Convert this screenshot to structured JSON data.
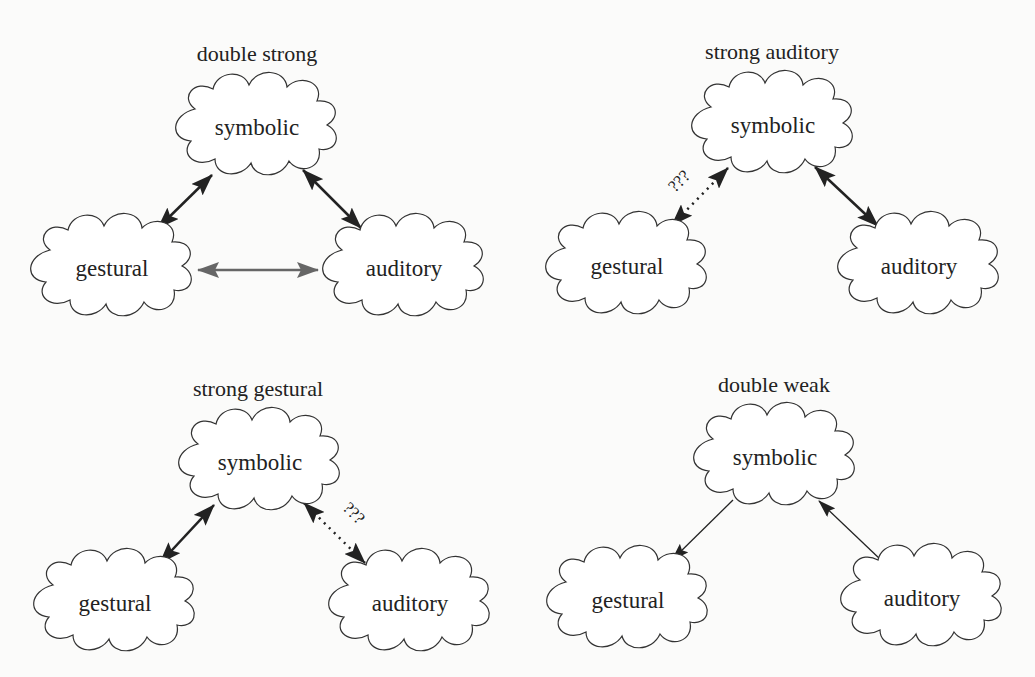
{
  "nodes": {
    "symbolic": "symbolic",
    "gestural": "gestural",
    "auditory": "auditory"
  },
  "uncertain_label": "???",
  "panels": [
    {
      "title": "double strong",
      "edges": [
        {
          "from": "symbolic",
          "to": "gestural",
          "style": "thick-bidirectional",
          "color": "#222222"
        },
        {
          "from": "symbolic",
          "to": "auditory",
          "style": "thick-bidirectional",
          "color": "#222222"
        },
        {
          "from": "gestural",
          "to": "auditory",
          "style": "thick-bidirectional",
          "color": "#666666"
        }
      ]
    },
    {
      "title": "strong auditory",
      "edges": [
        {
          "from": "symbolic",
          "to": "gestural",
          "style": "dotted-bidirectional",
          "label": "???"
        },
        {
          "from": "symbolic",
          "to": "auditory",
          "style": "thick-bidirectional",
          "color": "#222222"
        }
      ]
    },
    {
      "title": "strong gestural",
      "edges": [
        {
          "from": "symbolic",
          "to": "gestural",
          "style": "thick-bidirectional",
          "color": "#222222"
        },
        {
          "from": "symbolic",
          "to": "auditory",
          "style": "dotted-bidirectional",
          "label": "???"
        }
      ]
    },
    {
      "title": "double weak",
      "edges": [
        {
          "from": "symbolic",
          "to": "gestural",
          "style": "thin-directed"
        },
        {
          "from": "auditory",
          "to": "symbolic",
          "style": "thin-directed"
        }
      ]
    }
  ]
}
